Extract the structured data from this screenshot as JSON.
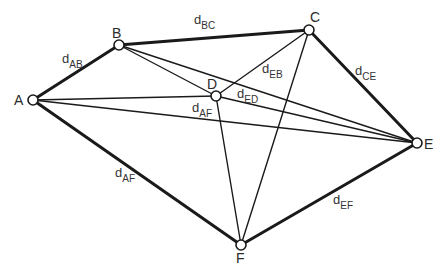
{
  "diagram": {
    "type": "network-graph",
    "nodes": [
      {
        "id": "A",
        "label": "A",
        "x": 33,
        "y": 100,
        "lx": 14,
        "ly": 105
      },
      {
        "id": "B",
        "label": "B",
        "x": 119,
        "y": 45,
        "lx": 112,
        "ly": 38
      },
      {
        "id": "C",
        "label": "C",
        "x": 309,
        "y": 30,
        "lx": 310,
        "ly": 22
      },
      {
        "id": "D",
        "label": "D",
        "x": 216,
        "y": 96,
        "lx": 207,
        "ly": 89
      },
      {
        "id": "E",
        "label": "E",
        "x": 417,
        "y": 143,
        "lx": 424,
        "ly": 149
      },
      {
        "id": "F",
        "label": "F",
        "x": 241,
        "y": 245,
        "lx": 236,
        "ly": 263
      }
    ],
    "edges": [
      {
        "from": "A",
        "to": "B",
        "weight": "thick"
      },
      {
        "from": "B",
        "to": "C",
        "weight": "thick"
      },
      {
        "from": "C",
        "to": "E",
        "weight": "thick"
      },
      {
        "from": "E",
        "to": "F",
        "weight": "thick"
      },
      {
        "from": "A",
        "to": "F",
        "weight": "thick"
      },
      {
        "from": "A",
        "to": "D",
        "weight": "thin"
      },
      {
        "from": "A",
        "to": "E",
        "weight": "thin"
      },
      {
        "from": "B",
        "to": "D",
        "weight": "thin"
      },
      {
        "from": "B",
        "to": "E",
        "weight": "thin"
      },
      {
        "from": "C",
        "to": "D",
        "weight": "thin"
      },
      {
        "from": "C",
        "to": "F",
        "weight": "thin"
      },
      {
        "from": "D",
        "to": "E",
        "weight": "thin"
      },
      {
        "from": "D",
        "to": "F",
        "weight": "thin"
      }
    ],
    "edge_labels": [
      {
        "main": "d",
        "sub": "AB",
        "x": 62,
        "y": 63
      },
      {
        "main": "d",
        "sub": "BC",
        "x": 194,
        "y": 24
      },
      {
        "main": "d",
        "sub": "EB",
        "x": 262,
        "y": 73
      },
      {
        "main": "d",
        "sub": "CE",
        "x": 355,
        "y": 75
      },
      {
        "main": "d",
        "sub": "ED",
        "x": 237,
        "y": 98
      },
      {
        "main": "d",
        "sub": "AF",
        "x": 192,
        "y": 112
      },
      {
        "main": "d",
        "sub": "AF",
        "x": 115,
        "y": 177
      },
      {
        "main": "d",
        "sub": "EF",
        "x": 333,
        "y": 204
      }
    ]
  }
}
